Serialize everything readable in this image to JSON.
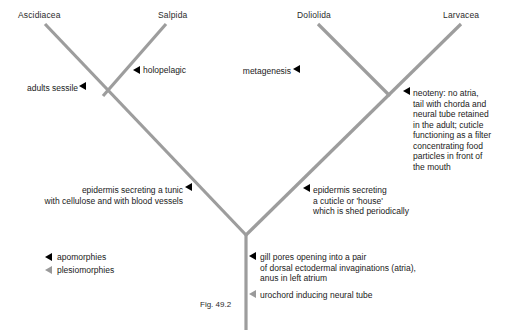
{
  "figure": {
    "caption": "Fig. 49.2",
    "branch_color": "#9d9d9d",
    "marker_filled_color": "#000000",
    "marker_open_color": "#9a9a9a",
    "text_color": "#1a1a1a"
  },
  "taxa": [
    {
      "name": "Ascidiacea",
      "x": 18,
      "y": 10
    },
    {
      "name": "Salpida",
      "x": 158,
      "y": 10
    },
    {
      "name": "Doliolida",
      "x": 297,
      "y": 10
    },
    {
      "name": "Larvacea",
      "x": 443,
      "y": 10
    }
  ],
  "annotations": {
    "adults_sessile": "adults sessile",
    "holopelagic": "holopelagic",
    "metagenesis": "metagenesis",
    "neoteny": "neoteny: no atria,\ntail with chorda and\nneural tube retained\nin the adult; cuticle\nfunctioning as a filter\nconcentrating food\nparticles in front of\nthe mouth",
    "epidermis_tunic": "epidermis secreting a tunic\nwith cellulose and with blood vessels",
    "epidermis_cuticle": "epidermis secreting\na cuticle or 'house'\nwhich is shed periodically",
    "gill_pores": "gill pores opening into a pair\nof dorsal ectodermal invaginations (atria),\nanus in left atrium",
    "urochord": "urochord inducing neural tube"
  },
  "legend": {
    "apomorphies": "apomorphies",
    "plesiomorphies": "plesiomorphies"
  }
}
